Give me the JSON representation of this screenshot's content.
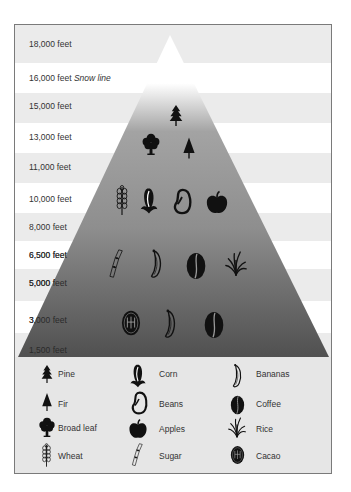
{
  "diagram": {
    "title": "",
    "bands": [
      {
        "label": "18,000 feet",
        "note": ""
      },
      {
        "label": "16,000 feet",
        "note": "Snow line"
      },
      {
        "label": "15,000 feet",
        "note": ""
      },
      {
        "label": "13,000 feet",
        "note": ""
      },
      {
        "label": "11,000 feet",
        "note": ""
      },
      {
        "label": "10,000 feet",
        "note": ""
      },
      {
        "label": "8,000 feet",
        "note": ""
      },
      {
        "label": "6,500 feet",
        "note": ""
      },
      {
        "label": "5,000 feet",
        "note": ""
      },
      {
        "label": "3,000 feet",
        "note": ""
      },
      {
        "label": "1,500 feet",
        "note": ""
      }
    ],
    "pyramid_rows": [
      {
        "level": "forest",
        "icons": [
          "pine",
          "broad-leaf",
          "fir"
        ]
      },
      {
        "level": "temperate",
        "icons": [
          "wheat",
          "corn",
          "beans",
          "apples"
        ]
      },
      {
        "level": "subtropical",
        "icons": [
          "sugar",
          "bananas",
          "coffee",
          "rice"
        ]
      },
      {
        "level": "tropical",
        "icons": [
          "cacao",
          "bananas",
          "coffee"
        ]
      }
    ],
    "colors": {
      "band_gray": "#ebebeb",
      "band_white": "#ffffff",
      "pyramid_top": "#ffffff",
      "pyramid_mid": "#9a9a9a",
      "pyramid_bottom": "#555555",
      "icon": "#111111",
      "frame": "#7a7a7a",
      "legend_bg": "#e6e6e6"
    }
  },
  "legend": {
    "items": [
      {
        "icon": "pine",
        "label": "Pine"
      },
      {
        "icon": "fir",
        "label": "Fir"
      },
      {
        "icon": "broad-leaf",
        "label": "Broad leaf"
      },
      {
        "icon": "wheat",
        "label": "Wheat"
      },
      {
        "icon": "corn",
        "label": "Corn"
      },
      {
        "icon": "beans",
        "label": "Beans"
      },
      {
        "icon": "apples",
        "label": "Apples"
      },
      {
        "icon": "sugar",
        "label": "Sugar"
      },
      {
        "icon": "bananas",
        "label": "Bananas"
      },
      {
        "icon": "coffee",
        "label": "Coffee"
      },
      {
        "icon": "rice",
        "label": "Rice"
      },
      {
        "icon": "cacao",
        "label": "Cacao"
      }
    ]
  }
}
